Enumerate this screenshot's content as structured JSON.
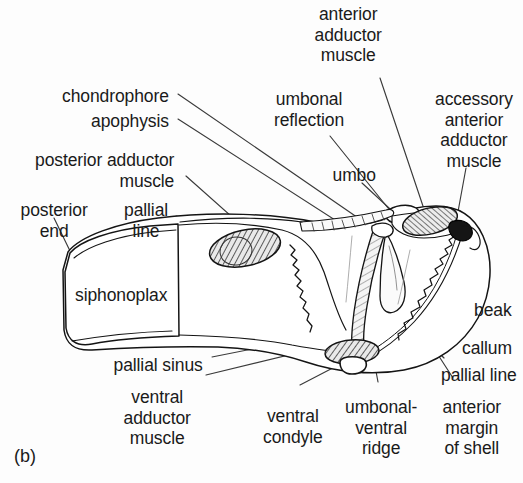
{
  "figure": {
    "caption": "(b)",
    "ink_color": "#1a1a1a",
    "background_color": "#fdfdfd"
  },
  "labels": [
    {
      "id": "anterior-adductor-muscle",
      "text": "anterior\nadductor\nmuscle",
      "x": 348,
      "y": 4,
      "align": "center"
    },
    {
      "id": "chondrophore",
      "text": "chondrophore",
      "x": 169,
      "y": 86,
      "align": "right"
    },
    {
      "id": "umbonal-reflection",
      "text": "umbonal\nreflection",
      "x": 309,
      "y": 89,
      "align": "center"
    },
    {
      "id": "accessory-anterior-adductor-muscle",
      "text": "accessory\nanterior\nadductor\nmuscle",
      "x": 474,
      "y": 89,
      "align": "center"
    },
    {
      "id": "apophysis",
      "text": "apophysis",
      "x": 169,
      "y": 111,
      "align": "right"
    },
    {
      "id": "posterior-adductor-muscle",
      "text": "posterior adductor\nmuscle",
      "x": 174,
      "y": 150,
      "align": "right"
    },
    {
      "id": "umbo",
      "text": "umbo",
      "x": 354,
      "y": 165,
      "align": "center"
    },
    {
      "id": "posterior-end",
      "text": "posterior\nend",
      "x": 54,
      "y": 200,
      "align": "center"
    },
    {
      "id": "pallial-line-left",
      "text": "pallial\nline",
      "x": 146,
      "y": 200,
      "align": "center"
    },
    {
      "id": "siphonoplax",
      "text": "siphonoplax",
      "x": 121,
      "y": 285,
      "align": "center"
    },
    {
      "id": "beak",
      "text": "beak",
      "x": 493,
      "y": 300,
      "align": "center"
    },
    {
      "id": "callum",
      "text": "callum",
      "x": 487,
      "y": 338,
      "align": "center"
    },
    {
      "id": "pallial-sinus",
      "text": "pallial sinus",
      "x": 158,
      "y": 355,
      "align": "center"
    },
    {
      "id": "pallial-line-right",
      "text": "pallial line",
      "x": 479,
      "y": 365,
      "align": "center"
    },
    {
      "id": "ventral-adductor-muscle",
      "text": "ventral\nadductor\nmuscle",
      "x": 157,
      "y": 387,
      "align": "center"
    },
    {
      "id": "ventral-condyle",
      "text": "ventral\ncondyle",
      "x": 293,
      "y": 406,
      "align": "center"
    },
    {
      "id": "umbonal-ventral-ridge",
      "text": "umbonal-\nventral\nridge",
      "x": 381,
      "y": 397,
      "align": "center"
    },
    {
      "id": "anterior-margin-of-shell",
      "text": "anterior\nmargin\nof shell",
      "x": 472,
      "y": 397,
      "align": "center"
    }
  ],
  "leader_lines": [
    {
      "id": "leader-anterior-adductor-muscle",
      "from": [
        380,
        78
      ],
      "to": [
        429,
        224
      ]
    },
    {
      "id": "leader-chondrophore",
      "from": [
        178,
        94
      ],
      "to": [
        380,
        233
      ]
    },
    {
      "id": "leader-apophysis",
      "from": [
        178,
        119
      ],
      "to": [
        377,
        247
      ]
    },
    {
      "id": "leader-umbonal-reflection",
      "from": [
        330,
        136
      ],
      "to": [
        392,
        213
      ]
    },
    {
      "id": "leader-accessory-anterior",
      "from": [
        466,
        168
      ],
      "to": [
        455,
        228
      ]
    },
    {
      "id": "leader-posterior-adductor",
      "from": [
        186,
        176
      ],
      "to": [
        258,
        240
      ]
    },
    {
      "id": "leader-umbo",
      "from": [
        362,
        183
      ],
      "to": [
        402,
        220
      ]
    },
    {
      "id": "leader-posterior-end",
      "from": [
        54,
        218
      ],
      "to": [
        71,
        253
      ]
    },
    {
      "id": "leader-pallial-line-left",
      "from": [
        176,
        216
      ],
      "to": [
        278,
        235
      ]
    },
    {
      "id": "leader-beak",
      "from": [
        478,
        290
      ],
      "to": [
        466,
        228
      ]
    },
    {
      "id": "leader-callum",
      "from": [
        462,
        337
      ],
      "to": [
        415,
        310
      ]
    },
    {
      "id": "leader-pallial-sinus",
      "from": [
        212,
        357
      ],
      "to": [
        348,
        330
      ]
    },
    {
      "id": "leader-pallial-line-right",
      "from": [
        444,
        358
      ],
      "to": [
        398,
        312
      ]
    },
    {
      "id": "leader-ventral-adductor",
      "from": [
        206,
        375
      ],
      "to": [
        330,
        345
      ]
    },
    {
      "id": "leader-ventral-condyle",
      "from": [
        300,
        385
      ],
      "to": [
        352,
        358
      ]
    },
    {
      "id": "leader-umbonal-ventral-ridge",
      "from": [
        378,
        382
      ],
      "to": [
        372,
        350
      ]
    },
    {
      "id": "leader-anterior-margin",
      "from": [
        453,
        378
      ],
      "to": [
        422,
        330
      ]
    }
  ],
  "anatomy_shapes": {
    "shell_outline": "Elongated valve outline with rounded anterior disc and posterior siphonoplax",
    "muscles": [
      {
        "id": "posterior-adductor-muscle-shape",
        "fill": "hatched",
        "cx": 245,
        "cy": 248
      },
      {
        "id": "anterior-adductor-muscle-shape",
        "fill": "hatched",
        "cx": 430,
        "cy": 222
      },
      {
        "id": "accessory-anterior-adductor-muscle-shape",
        "fill": "dark",
        "cx": 459,
        "cy": 230
      },
      {
        "id": "ventral-adductor-muscle-shape",
        "fill": "hatched",
        "cx": 352,
        "cy": 352
      },
      {
        "id": "ventral-condyle-shape",
        "fill": "white",
        "cx": 353,
        "cy": 367
      }
    ]
  }
}
